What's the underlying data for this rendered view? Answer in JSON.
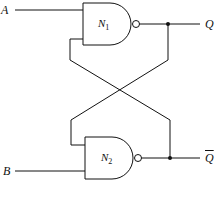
{
  "diagram": {
    "type": "SR latch (cross-coupled NAND gates)",
    "inputs": [
      {
        "id": "A",
        "label": "A"
      },
      {
        "id": "B",
        "label": "B"
      }
    ],
    "gates": [
      {
        "id": "N1",
        "type": "NAND",
        "label": "N",
        "subscript": "1"
      },
      {
        "id": "N2",
        "type": "NAND",
        "label": "N",
        "subscript": "2"
      }
    ],
    "outputs": [
      {
        "id": "Q",
        "label": "Q"
      },
      {
        "id": "Qbar",
        "label": "Q"
      }
    ],
    "connections": [
      "A -> N1.in1",
      "B -> N2.in2",
      "N1.out -> Q",
      "N2.out -> Qbar",
      "Q -> N2.in1 (cross)",
      "Qbar -> N1.in2 (cross)"
    ],
    "colors": {
      "line": "#111111",
      "background": "#ffffff"
    }
  }
}
